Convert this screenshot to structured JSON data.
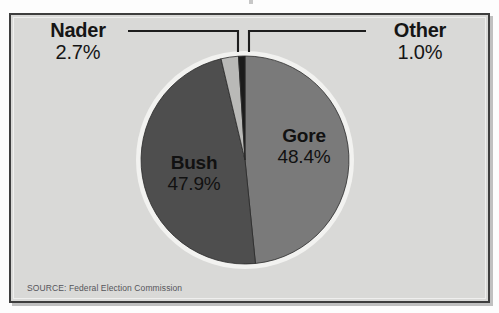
{
  "frame": {
    "background_color": "#d9d9d7",
    "border_color": "#3e3e3e",
    "page_color": "#fdfdfd"
  },
  "source_note": "SOURCE: Federal Election Commission",
  "labels": {
    "nader": {
      "name": "Nader",
      "pct": "2.7%"
    },
    "other": {
      "name": "Other",
      "pct": "1.0%"
    },
    "gore": {
      "name": "Gore",
      "pct": "48.4%"
    },
    "bush": {
      "name": "Bush",
      "pct": "47.9%"
    }
  },
  "chart_data": {
    "type": "pie",
    "title": "",
    "subtitle": "",
    "xlabel": "",
    "ylabel": "",
    "legend_position": "none",
    "grid": false,
    "units": "percent",
    "start_angle_deg": 0,
    "direction": "clockwise",
    "center": {
      "x": 245,
      "y": 160
    },
    "radius": 104,
    "ring_color": "#f2f2f0",
    "ring_width": 5,
    "annotations": [
      "SOURCE: Federal Election Commission"
    ],
    "categories": [
      "Gore",
      "Bush",
      "Nader",
      "Other"
    ],
    "values": [
      48.4,
      47.9,
      2.7,
      1.0
    ],
    "slices": [
      {
        "label": "Gore",
        "value": 48.4,
        "display": "48.4%",
        "color": "#7a7a7a",
        "label_placement": "inside",
        "order": 1
      },
      {
        "label": "Bush",
        "value": 47.9,
        "display": "47.9%",
        "color": "#4e4e4e",
        "label_placement": "inside",
        "order": 2
      },
      {
        "label": "Nader",
        "value": 2.7,
        "display": "2.7%",
        "color": "#b9b9b7",
        "label_placement": "callout-left",
        "order": 3
      },
      {
        "label": "Other",
        "value": 1.0,
        "display": "1.0%",
        "color": "#1b1b1b",
        "label_placement": "callout-right",
        "order": 4
      }
    ]
  }
}
